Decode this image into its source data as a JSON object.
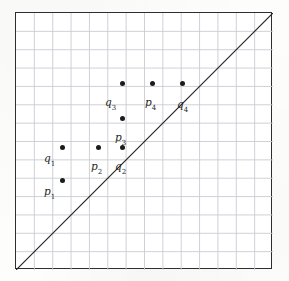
{
  "figure": {
    "background_color": "#fdfdfc",
    "paper_color": "#ffffff",
    "border_color": "#2e2e2e",
    "grid_color": "#c9ccd2",
    "ink_color": "#1b1b1b"
  },
  "plot_box": {
    "x": 15,
    "y": 12,
    "width": 257,
    "height": 257,
    "grid_columns": 14,
    "grid_rows": 14
  },
  "diagonal": {
    "name": "diagonal-line",
    "from_x": 15,
    "from_y": 269,
    "to_x": 272,
    "to_y": 12,
    "color": "#262626",
    "width": 1.2
  },
  "points": [
    {
      "id": "p1",
      "base": "p",
      "sub": "1",
      "x": 62,
      "y": 180,
      "label_x": 44,
      "label_y": 186,
      "label_anchor": "left"
    },
    {
      "id": "q1",
      "base": "q",
      "sub": "1",
      "x": 62,
      "y": 147,
      "label_x": 44,
      "label_y": 153,
      "label_anchor": "left"
    },
    {
      "id": "p2",
      "base": "p",
      "sub": "2",
      "x": 98,
      "y": 147,
      "label_x": 91,
      "label_y": 161,
      "label_anchor": "left"
    },
    {
      "id": "q2",
      "base": "q",
      "sub": "2",
      "x": 122,
      "y": 147,
      "label_x": 115,
      "label_y": 161,
      "label_anchor": "left"
    },
    {
      "id": "p3",
      "base": "p",
      "sub": "3",
      "x": 122,
      "y": 118,
      "label_x": 115,
      "label_y": 132,
      "label_anchor": "left"
    },
    {
      "id": "q3",
      "base": "q",
      "sub": "3",
      "x": 122,
      "y": 83,
      "label_x": 105,
      "label_y": 97,
      "label_anchor": "left"
    },
    {
      "id": "p4",
      "base": "p",
      "sub": "4",
      "x": 152,
      "y": 83,
      "label_x": 145,
      "label_y": 97,
      "label_anchor": "left"
    },
    {
      "id": "q4",
      "base": "q",
      "sub": "4",
      "x": 182,
      "y": 83,
      "label_x": 177,
      "label_y": 99,
      "label_anchor": "left"
    }
  ],
  "chart_data": {
    "type": "scatter",
    "title": "",
    "xlabel": "",
    "ylabel": "",
    "xlim": [
      0,
      14
    ],
    "ylim": [
      0,
      14
    ],
    "grid": true,
    "legend": "none",
    "annotations": [
      {
        "text": "diagonal y = x drawn corner to corner"
      }
    ],
    "series": [
      {
        "name": "labeled points",
        "points": [
          {
            "label": "p1",
            "x": 2.55,
            "y": 4.85
          },
          {
            "label": "q1",
            "x": 2.55,
            "y": 6.65
          },
          {
            "label": "p2",
            "x": 4.52,
            "y": 6.65
          },
          {
            "label": "q2",
            "x": 5.83,
            "y": 6.65
          },
          {
            "label": "p3",
            "x": 5.83,
            "y": 8.23
          },
          {
            "label": "q3",
            "x": 5.83,
            "y": 10.13
          },
          {
            "label": "p4",
            "x": 7.46,
            "y": 10.13
          },
          {
            "label": "q4",
            "x": 9.09,
            "y": 10.13
          }
        ]
      }
    ]
  }
}
